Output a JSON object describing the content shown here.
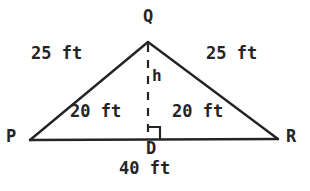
{
  "figure": {
    "type": "isosceles-triangle-with-altitude",
    "stroke_color": "#242424",
    "background_color": "#ffffff",
    "vertices": {
      "Q": {
        "label": "Q",
        "x": 148,
        "y": 42
      },
      "P": {
        "label": "P",
        "x": 30,
        "y": 140
      },
      "R": {
        "label": "R",
        "x": 278,
        "y": 139
      },
      "D": {
        "label": "D",
        "x": 148,
        "y": 139
      }
    },
    "side_labels": {
      "PQ": "25 ft",
      "QR": "25 ft",
      "PD": "20 ft",
      "DR": "20 ft",
      "PR": "40 ft",
      "QD": "h"
    },
    "right_angle_at": "D",
    "altitude_style": "dashed"
  }
}
